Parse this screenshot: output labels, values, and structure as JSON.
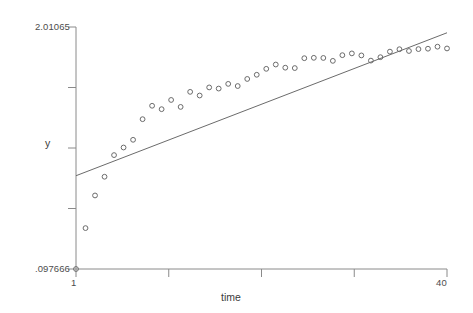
{
  "chart_data": {
    "type": "scatter",
    "title": "",
    "subtitle": "",
    "xlabel": "time",
    "ylabel": "y",
    "xlim": [
      1,
      40
    ],
    "ylim": [
      0.097666,
      2.01065
    ],
    "grid": false,
    "legend": "none",
    "x_tick_labels": [
      "1",
      "40"
    ],
    "y_tick_labels": [
      "2.01065",
      ".097666"
    ],
    "x_tick_values": [
      1,
      40
    ],
    "y_tick_values": [
      2.01065,
      0.097666
    ],
    "x_minor_tick_count": 5,
    "y_minor_tick_count": 5,
    "marker": "open-circle",
    "marker_color": "#6b6b6b",
    "line_color": "#6b6b6b",
    "axis_color": "#8a8a8a",
    "background_color": "#ffffff",
    "series": [
      {
        "name": "y",
        "type": "scatter",
        "x": [
          1,
          2,
          3,
          4,
          5,
          6,
          7,
          8,
          9,
          10,
          11,
          12,
          13,
          14,
          15,
          16,
          17,
          18,
          19,
          20,
          21,
          22,
          23,
          24,
          25,
          26,
          27,
          28,
          29,
          30,
          31,
          32,
          33,
          34,
          35,
          36,
          37,
          38,
          39,
          40
        ],
        "values": [
          0.0977,
          0.421,
          0.679,
          0.827,
          0.998,
          1.058,
          1.119,
          1.282,
          1.388,
          1.361,
          1.434,
          1.379,
          1.498,
          1.469,
          1.533,
          1.524,
          1.561,
          1.544,
          1.6,
          1.633,
          1.68,
          1.714,
          1.689,
          1.686,
          1.764,
          1.767,
          1.766,
          1.743,
          1.788,
          1.802,
          1.786,
          1.745,
          1.772,
          1.816,
          1.835,
          1.821,
          1.836,
          1.839,
          1.855,
          1.841
        ]
      },
      {
        "name": "fitted line",
        "type": "line",
        "x": [
          1,
          40
        ],
        "values": [
          0.835,
          1.965
        ]
      }
    ]
  },
  "axes": {
    "y_top_label": "2.01065",
    "y_bottom_label": ".097666",
    "x_left_label": "1",
    "x_right_label": "40",
    "y_axis_title": "y",
    "x_axis_title": "time"
  }
}
